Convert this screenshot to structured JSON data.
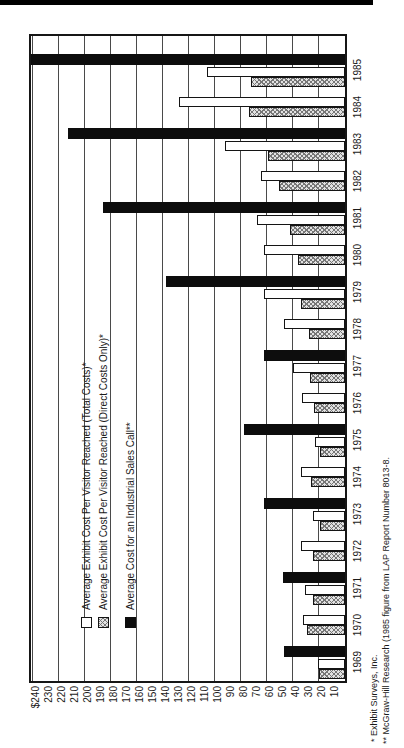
{
  "chart_data": {
    "type": "bar",
    "title": "",
    "orientation": "figure printed rotated 90 degrees counter-clockwise on page",
    "categories": [
      "1969",
      "1970",
      "1971",
      "1972",
      "1973",
      "1974",
      "1975",
      "1976",
      "1977",
      "1978",
      "1979",
      "1980",
      "1981",
      "1982",
      "1983",
      "1984",
      "1985"
    ],
    "series": [
      {
        "name": "Average Exhibit Cost Per Visitor Reached (Total Costs)*",
        "swatch": "white",
        "values": [
          21,
          32,
          31,
          34,
          25,
          34,
          23,
          33,
          40,
          47,
          62,
          62,
          68,
          65,
          92,
          128,
          106
        ]
      },
      {
        "name": "Average Exhibit Cost Per Visitor Reached (Direct Costs Only)*",
        "swatch": "hatch",
        "values": [
          20,
          29,
          25,
          25,
          19,
          26,
          19,
          24,
          27,
          28,
          34,
          36,
          42,
          51,
          59,
          74,
          72
        ]
      },
      {
        "name": "Average Cost for an Industrial Sales Call**",
        "swatch": "black",
        "values": [
          47,
          null,
          48,
          null,
          62,
          null,
          78,
          null,
          62,
          null,
          138,
          null,
          186,
          null,
          213,
          null,
          242
        ]
      }
    ],
    "ylim": [
      0,
      244
    ],
    "ytick_label_step": 10,
    "grid_step": 20,
    "grid_on": true,
    "legend_position": "upper-left",
    "ytick_labels": [
      "$240",
      "230",
      "220",
      "210",
      "200",
      "190",
      "180",
      "170",
      "160",
      "150",
      "140",
      "130",
      "120",
      "110",
      "100",
      "90",
      "80",
      "70",
      "60",
      "50",
      "40",
      "30",
      "20",
      "10"
    ]
  },
  "footnotes": {
    "line1": "* Exhibit Surveys, Inc.",
    "line2": "** McGraw-Hill Research (1985 figure from LAP Report Number 8013-8."
  },
  "colors": {
    "bar_black": "#0d0d0d",
    "bar_white": "#ffffff",
    "hatch_line": "#767676",
    "frame": "#161616",
    "grid": "#4a4a4a",
    "page_rule": "#000000",
    "background": "#ffffff",
    "text": "#1a1a1a"
  }
}
